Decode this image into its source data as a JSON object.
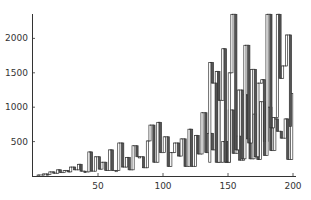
{
  "chart_data": {
    "type": "candlestick",
    "title": "",
    "xlabel": "",
    "ylabel": "",
    "xlim": [
      0,
      200
    ],
    "ylim": [
      0,
      2350
    ],
    "grid": false,
    "legend": null,
    "x_ticks": [
      50,
      100,
      150,
      200
    ],
    "y_ticks": [
      500,
      1000,
      1500,
      2000
    ],
    "colors": {
      "increasing_fill": "#ffffff",
      "decreasing_fill": "#555555",
      "stroke": "#333333",
      "axis": "#333333"
    },
    "note": "Values approximated from pixels; boxes span open-close, connecting lines join consecutive candles.",
    "series": [
      {
        "x": 4,
        "open": 5,
        "close": 15
      },
      {
        "x": 8,
        "open": 15,
        "close": 30
      },
      {
        "x": 11,
        "open": 30,
        "close": 20
      },
      {
        "x": 13,
        "open": 20,
        "close": 60
      },
      {
        "x": 16,
        "open": 60,
        "close": 40
      },
      {
        "x": 19,
        "open": 40,
        "close": 90
      },
      {
        "x": 21,
        "open": 90,
        "close": 50
      },
      {
        "x": 24,
        "open": 50,
        "close": 80
      },
      {
        "x": 27,
        "open": 80,
        "close": 60
      },
      {
        "x": 29,
        "open": 60,
        "close": 130
      },
      {
        "x": 32,
        "open": 130,
        "close": 90
      },
      {
        "x": 35,
        "open": 90,
        "close": 170
      },
      {
        "x": 37,
        "open": 170,
        "close": 70
      },
      {
        "x": 40,
        "open": 70,
        "close": 60
      },
      {
        "x": 43,
        "open": 60,
        "close": 350
      },
      {
        "x": 45,
        "open": 350,
        "close": 70
      },
      {
        "x": 48,
        "open": 70,
        "close": 280
      },
      {
        "x": 51,
        "open": 280,
        "close": 100
      },
      {
        "x": 53,
        "open": 100,
        "close": 200
      },
      {
        "x": 56,
        "open": 200,
        "close": 80
      },
      {
        "x": 59,
        "open": 80,
        "close": 380
      },
      {
        "x": 61,
        "open": 380,
        "close": 80
      },
      {
        "x": 64,
        "open": 80,
        "close": 80
      },
      {
        "x": 66,
        "open": 80,
        "close": 480
      },
      {
        "x": 69,
        "open": 480,
        "close": 130
      },
      {
        "x": 72,
        "open": 130,
        "close": 270
      },
      {
        "x": 74,
        "open": 270,
        "close": 90
      },
      {
        "x": 77,
        "open": 90,
        "close": 440
      },
      {
        "x": 80,
        "open": 440,
        "close": 280
      },
      {
        "x": 82,
        "open": 280,
        "close": 280
      },
      {
        "x": 85,
        "open": 280,
        "close": 120
      },
      {
        "x": 88,
        "open": 120,
        "close": 510
      },
      {
        "x": 90,
        "open": 510,
        "close": 740
      },
      {
        "x": 93,
        "open": 740,
        "close": 200
      },
      {
        "x": 96,
        "open": 200,
        "close": 780
      },
      {
        "x": 98,
        "open": 780,
        "close": 340
      },
      {
        "x": 101,
        "open": 340,
        "close": 570
      },
      {
        "x": 104,
        "open": 570,
        "close": 140
      },
      {
        "x": 106,
        "open": 140,
        "close": 340
      },
      {
        "x": 109,
        "open": 340,
        "close": 480
      },
      {
        "x": 112,
        "open": 480,
        "close": 290
      },
      {
        "x": 114,
        "open": 290,
        "close": 540
      },
      {
        "x": 117,
        "open": 540,
        "close": 140
      },
      {
        "x": 120,
        "open": 140,
        "close": 680
      },
      {
        "x": 122,
        "open": 680,
        "close": 140
      },
      {
        "x": 125,
        "open": 140,
        "close": 590
      },
      {
        "x": 127,
        "open": 590,
        "close": 320
      },
      {
        "x": 130,
        "open": 320,
        "close": 920
      },
      {
        "x": 133,
        "open": 920,
        "close": 340
      },
      {
        "x": 135,
        "open": 340,
        "close": 620
      },
      {
        "x": 138,
        "open": 620,
        "close": 380
      },
      {
        "x": 141,
        "open": 380,
        "close": 1520
      },
      {
        "x": 143,
        "open": 1520,
        "close": 200
      },
      {
        "x": 146,
        "open": 200,
        "close": 500
      },
      {
        "x": 149,
        "open": 500,
        "close": 200
      },
      {
        "x": 151,
        "open": 200,
        "close": 960
      },
      {
        "x": 154,
        "open": 960,
        "close": 330
      },
      {
        "x": 157,
        "open": 330,
        "close": 580
      },
      {
        "x": 159,
        "open": 580,
        "close": 230
      },
      {
        "x": 162,
        "open": 230,
        "close": 1180
      },
      {
        "x": 165,
        "open": 1180,
        "close": 540
      },
      {
        "x": 167,
        "open": 540,
        "close": 250
      },
      {
        "x": 170,
        "open": 250,
        "close": 900
      },
      {
        "x": 173,
        "open": 900,
        "close": 240
      },
      {
        "x": 175,
        "open": 240,
        "close": 1080
      },
      {
        "x": 178,
        "open": 1080,
        "close": 500
      },
      {
        "x": 180,
        "open": 500,
        "close": 1000
      },
      {
        "x": 183,
        "open": 1000,
        "close": 370
      },
      {
        "x": 186,
        "open": 370,
        "close": 830
      },
      {
        "x": 188,
        "open": 830,
        "close": 650
      },
      {
        "x": 191,
        "open": 650,
        "close": 550
      },
      {
        "x": 194,
        "open": 550,
        "close": 830
      },
      {
        "x": 196,
        "open": 830,
        "close": 240
      },
      {
        "x": 199,
        "open": 240,
        "close": 1200
      }
    ],
    "series_upper": [
      {
        "x": 136,
        "open": 200,
        "close": 1650
      },
      {
        "x": 138,
        "open": 1650,
        "close": 1350
      },
      {
        "x": 141,
        "open": 1350,
        "close": 200
      },
      {
        "x": 143,
        "open": 200,
        "close": 1100
      },
      {
        "x": 146,
        "open": 1100,
        "close": 1850
      },
      {
        "x": 148,
        "open": 1850,
        "close": 200
      },
      {
        "x": 151,
        "open": 200,
        "close": 1500
      },
      {
        "x": 153,
        "open": 1500,
        "close": 2350
      },
      {
        "x": 156,
        "open": 2350,
        "close": 380
      },
      {
        "x": 158,
        "open": 380,
        "close": 1250
      },
      {
        "x": 161,
        "open": 1250,
        "close": 250
      },
      {
        "x": 163,
        "open": 250,
        "close": 1900
      },
      {
        "x": 166,
        "open": 1900,
        "close": 480
      },
      {
        "x": 168,
        "open": 480,
        "close": 1550
      },
      {
        "x": 171,
        "open": 1550,
        "close": 280
      },
      {
        "x": 173,
        "open": 280,
        "close": 1350
      },
      {
        "x": 176,
        "open": 1350,
        "close": 1400
      },
      {
        "x": 178,
        "open": 1400,
        "close": 300
      },
      {
        "x": 180,
        "open": 300,
        "close": 2350
      },
      {
        "x": 183,
        "open": 2350,
        "close": 700
      },
      {
        "x": 185,
        "open": 700,
        "close": 850
      },
      {
        "x": 188,
        "open": 850,
        "close": 2350
      },
      {
        "x": 190,
        "open": 2350,
        "close": 1420
      },
      {
        "x": 192,
        "open": 1420,
        "close": 1600
      },
      {
        "x": 195,
        "open": 1600,
        "close": 2050
      },
      {
        "x": 198,
        "open": 2050,
        "close": 720
      }
    ]
  }
}
